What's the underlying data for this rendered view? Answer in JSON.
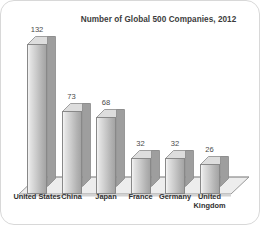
{
  "chart_data": {
    "type": "bar",
    "title": "Number of Global 500 Companies, 2012",
    "xlabel": "",
    "ylabel": "",
    "ylim": [
      0,
      132
    ],
    "grid": false,
    "legend": false,
    "style": "3d-bar",
    "categories": [
      "United States",
      "China",
      "Japan",
      "France",
      "Germany",
      "United\nKingdom"
    ],
    "values": [
      132,
      73,
      68,
      32,
      32,
      26
    ],
    "value_labels": [
      "132",
      "73",
      "68",
      "32",
      "32",
      "26"
    ],
    "bar_color": "#c9c9c9",
    "bar_edge_color": "#888888",
    "floor_color": "#e8e8e8",
    "text_color": "#303030",
    "background": "#ffffff"
  }
}
